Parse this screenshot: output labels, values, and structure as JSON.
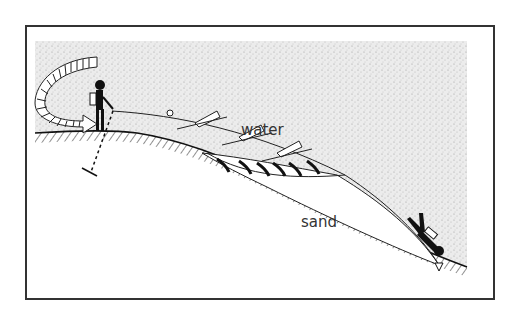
{
  "diagram": {
    "type": "cross-section illustration",
    "labels": {
      "water": "water",
      "sand": "sand"
    },
    "elements": [
      "curved-striped-arrow",
      "person-on-shore",
      "line-with-floats",
      "ground-stake-dashed-line",
      "sand-deposit-arrows",
      "diver",
      "seabed-anchor"
    ],
    "colors": {
      "frame": "#333333",
      "water_stipple": "#d9d9d9",
      "ink": "#111111",
      "background": "#ffffff"
    }
  }
}
